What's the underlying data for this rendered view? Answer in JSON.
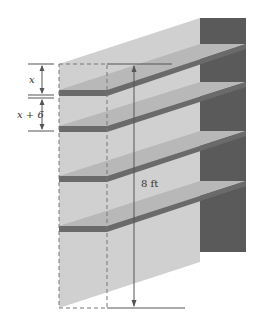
{
  "figure": {
    "labels": {
      "top_gap": "x",
      "second_gap": "x + 6",
      "total_height": "8 ft"
    },
    "shelf_count": 4,
    "colors": {
      "background": "#ffffff",
      "side_wall": "#cfcfcf",
      "back_panel": "#5a5a5a",
      "shelf_top": "#b4b4b4",
      "shelf_edge": "#6a6a6a",
      "dimension_line": "#555555",
      "dashed_outline": "#777777"
    }
  }
}
